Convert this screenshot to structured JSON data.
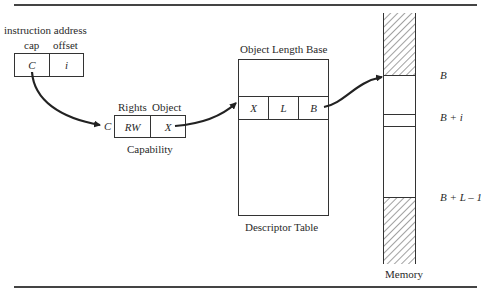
{
  "instruction": {
    "title": "instruction address",
    "fields": [
      {
        "header": "cap",
        "value": "C"
      },
      {
        "header": "offset",
        "value": "i"
      }
    ]
  },
  "capability": {
    "pointer_label": "C",
    "headers": [
      "Rights",
      "Object"
    ],
    "values": [
      "RW",
      "X"
    ],
    "caption": "Capability"
  },
  "descriptor_table": {
    "header": "Object Length Base",
    "entry": [
      "X",
      "L",
      "B"
    ],
    "caption": "Descriptor Table"
  },
  "memory": {
    "caption": "Memory",
    "markers": [
      "B",
      "B + i",
      "B + L – 1"
    ]
  },
  "colors": {
    "line": "#333333",
    "text": "#2a2a2a",
    "background": "#ffffff"
  }
}
